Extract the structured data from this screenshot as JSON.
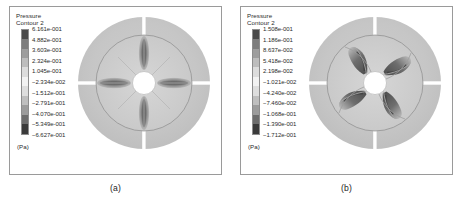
{
  "figure": {
    "panels": [
      {
        "caption": "(a)",
        "legend": {
          "title_line1": "Pressure",
          "title_line2": "Contour 2",
          "unit": "(Pa)",
          "ticks": [
            "6.161e-001",
            "4.882e-001",
            "3.603e-001",
            "2.324e-001",
            "1.045e-001",
            "−2.334e-002",
            "−1.512e-001",
            "−2.791e-001",
            "−4.070e-001",
            "−5.349e-001",
            "−6.627e-001"
          ]
        }
      },
      {
        "caption": "(b)",
        "legend": {
          "title_line1": "Pressure",
          "title_line2": "Contour 2",
          "unit": "(Pa)",
          "ticks": [
            "1.508e-001",
            "1.186e-001",
            "8.637e-002",
            "5.418e-002",
            "2.198e-002",
            "−1.021e-002",
            "−4.240e-002",
            "−7.460e-002",
            "−1.068e-001",
            "−1.390e-001",
            "−1.712e-001"
          ]
        }
      }
    ]
  },
  "chart_data": [
    {
      "type": "heatmap",
      "title": "Pressure Contour 2",
      "panel": "(a)",
      "subject": "straight-radial-blade impeller pressure contour",
      "colormap": "grayscale-banded",
      "bands": 10,
      "unit": "Pa",
      "legend_position": "left",
      "grid": false,
      "colorbar_ticks": [
        0.6161,
        0.4882,
        0.3603,
        0.2324,
        0.1045,
        -0.02334,
        -0.1512,
        -0.2791,
        -0.407,
        -0.5349,
        -0.6627
      ],
      "colorbar_tick_labels": [
        "6.161e-001",
        "4.882e-001",
        "3.603e-001",
        "2.324e-001",
        "1.045e-001",
        "−2.334e-002",
        "−1.512e-001",
        "−2.791e-001",
        "−4.070e-001",
        "−5.349e-001",
        "−6.627e-001"
      ],
      "zlim": [
        -0.6627,
        0.6161
      ],
      "blade_count": 4,
      "blade_type": "straight radial",
      "blade_angles_deg": [
        0,
        90,
        180,
        270
      ],
      "slot_angles_deg": [
        0,
        90,
        180,
        270
      ]
    },
    {
      "type": "heatmap",
      "title": "Pressure Contour 2",
      "panel": "(b)",
      "subject": "curved swept-blade impeller pressure contour",
      "colormap": "grayscale-banded",
      "bands": 10,
      "unit": "Pa",
      "legend_position": "left",
      "grid": false,
      "colorbar_ticks": [
        0.1508,
        0.1186,
        0.08637,
        0.05418,
        0.02198,
        -0.01021,
        -0.0424,
        -0.0746,
        -0.1068,
        -0.139,
        -0.1712
      ],
      "colorbar_tick_labels": [
        "1.508e-001",
        "1.186e-001",
        "8.637e-002",
        "5.418e-002",
        "2.198e-002",
        "−1.021e-002",
        "−4.240e-002",
        "−7.460e-002",
        "−1.068e-001",
        "−1.390e-001",
        "−1.712e-001"
      ],
      "zlim": [
        -0.1712,
        0.1508
      ],
      "blade_count": 4,
      "blade_type": "curved / backward swept",
      "blade_angles_deg": [
        45,
        135,
        225,
        315
      ],
      "slot_angles_deg": [
        0,
        90,
        180,
        270
      ]
    }
  ],
  "colors": {
    "frame_border": "#9a9a9a",
    "text": "#2b2b2b",
    "disk_outer": "#c8c8c8",
    "disk_inner": "#cfcfcf",
    "hub": "#ffffff",
    "blade_dark": "#6f6f6f",
    "colorbar_stops": [
      "#4a4a4a",
      "#7d7d7d",
      "#9e9e9e",
      "#bdbdbd",
      "#dcdcdc",
      "#f2f2f2",
      "#dedede",
      "#bfbfbf",
      "#9c9c9c",
      "#6d6d6d",
      "#3a3a3a"
    ]
  }
}
